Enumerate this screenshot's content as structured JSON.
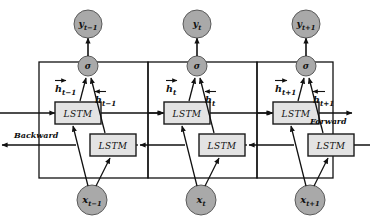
{
  "figure": {
    "background_color": "#ffffff",
    "node_fill": "#a9a9a9",
    "node_stroke": "#5a5a5a",
    "box_fill": "#e3e3e3",
    "box_stroke": "#1a1a1a",
    "line_color": "#111111"
  },
  "direction_labels": {
    "backward": "Backward",
    "forward": "Forward"
  },
  "cells": [
    {
      "id": "t-minus-1",
      "input_label": "x",
      "input_sub": "t−1",
      "output_label": "y",
      "output_sub": "t−1",
      "activation_label": "σ",
      "forward_state_label": "h",
      "forward_state_sub": "t−1",
      "backward_state_label": "h",
      "backward_state_sub": "t−1",
      "forward_cell_label": "LSTM",
      "backward_cell_label": "LSTM"
    },
    {
      "id": "t",
      "input_label": "x",
      "input_sub": "t",
      "output_label": "y",
      "output_sub": "t",
      "activation_label": "σ",
      "forward_state_label": "h",
      "forward_state_sub": "t",
      "backward_state_label": "h",
      "backward_state_sub": "t",
      "forward_cell_label": "LSTM",
      "backward_cell_label": "LSTM"
    },
    {
      "id": "t-plus-1",
      "input_label": "x",
      "input_sub": "t+1",
      "output_label": "y",
      "output_sub": "t+1",
      "activation_label": "σ",
      "forward_state_label": "h",
      "forward_state_sub": "t+1",
      "backward_state_label": "h",
      "backward_state_sub": "t+1",
      "forward_cell_label": "LSTM",
      "backward_cell_label": "LSTM"
    }
  ]
}
